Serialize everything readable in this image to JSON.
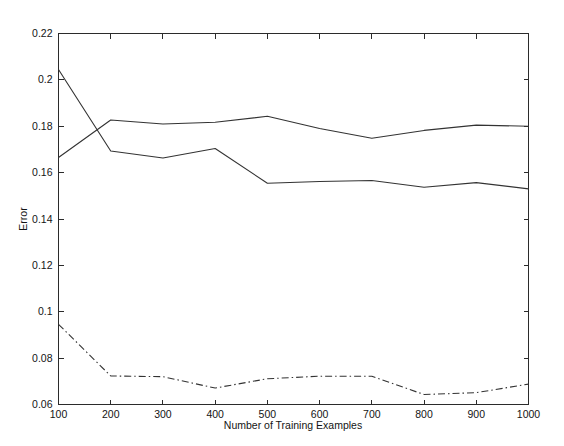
{
  "figure": {
    "background_color": "#ffffff",
    "line_color": "#333333",
    "axis_color": "#2b2b2b"
  },
  "chart_data": {
    "type": "line",
    "title": "",
    "xlabel": "Number of Training Examples",
    "ylabel": "Error",
    "x": [
      100,
      200,
      300,
      400,
      500,
      600,
      700,
      800,
      900,
      1000
    ],
    "xlim": [
      100,
      1000
    ],
    "ylim": [
      0.06,
      0.22
    ],
    "xticks": [
      100,
      200,
      300,
      400,
      500,
      600,
      700,
      800,
      900,
      1000
    ],
    "xticklabels": [
      "100",
      "200",
      "300",
      "400",
      "500",
      "600",
      "700",
      "800",
      "900",
      "1000"
    ],
    "yticks": [
      0.06,
      0.08,
      0.1,
      0.12,
      0.14,
      0.16,
      0.18,
      0.2,
      0.22
    ],
    "yticklabels": [
      "0.06",
      "0.08",
      "0.1",
      "0.12",
      "0.14",
      "0.16",
      "0.18",
      "0.2",
      "0.22"
    ],
    "grid": false,
    "legend": "none",
    "series": [
      {
        "name": "series-1",
        "style": "solid",
        "values": [
          0.2045,
          0.1693,
          0.1663,
          0.1704,
          0.1554,
          0.1562,
          0.1566,
          0.1537,
          0.1557,
          0.153
        ]
      },
      {
        "name": "series-2",
        "style": "solid",
        "values": [
          0.1665,
          0.1827,
          0.181,
          0.1817,
          0.1843,
          0.179,
          0.1748,
          0.1782,
          0.1805,
          0.18
        ]
      },
      {
        "name": "series-3",
        "style": "dash-dot",
        "values": [
          0.0946,
          0.0723,
          0.072,
          0.0671,
          0.0711,
          0.0722,
          0.0722,
          0.0643,
          0.0651,
          0.0688
        ]
      }
    ]
  }
}
